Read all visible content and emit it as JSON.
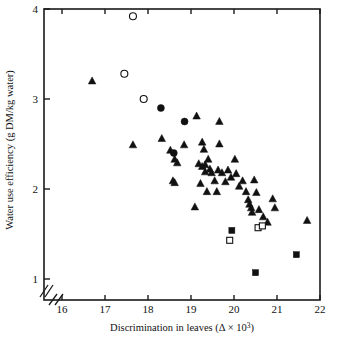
{
  "figure": {
    "background": "#ffffff",
    "frame_color": "#1a1a1a",
    "marker_color": "#111111"
  },
  "axes": {
    "x": {
      "label_main": "Discrimination in leaves (",
      "label_symbol": "Δ × 10",
      "label_exp": "3",
      "label_close": ")",
      "label_full": "Discrimination in leaves (Δ × 10³)",
      "ticks": [
        "16",
        "17",
        "18",
        "19",
        "20",
        "21",
        "22"
      ],
      "tick_values": [
        16,
        17,
        18,
        19,
        20,
        21,
        22
      ],
      "range": [
        15.55,
        22
      ],
      "broken": true
    },
    "y": {
      "label_full": "Water use efficiency (g DM/kg water)",
      "ticks": [
        "1",
        "2",
        "3",
        "4"
      ],
      "tick_values": [
        1,
        2,
        3,
        4
      ],
      "range": [
        0.78,
        4
      ],
      "broken": true
    }
  },
  "chart_data": {
    "type": "scatter",
    "title": "",
    "xlabel": "Discrimination in leaves (Δ × 10³)",
    "ylabel": "Water use efficiency (g DM/kg water)",
    "xlim": [
      15.55,
      22
    ],
    "ylim": [
      0.78,
      4
    ],
    "grid": false,
    "legend": "none",
    "xticks": [
      16,
      17,
      18,
      19,
      20,
      21,
      22
    ],
    "yticks": [
      1,
      2,
      3,
      4
    ],
    "series": [
      {
        "name": "filled-triangle",
        "marker": "triangle",
        "fill": "solid",
        "points": [
          [
            16.7,
            3.2
          ],
          [
            17.65,
            2.49
          ],
          [
            18.32,
            2.56
          ],
          [
            18.52,
            2.43
          ],
          [
            18.62,
            2.33
          ],
          [
            18.68,
            2.29
          ],
          [
            18.58,
            2.09
          ],
          [
            18.62,
            2.07
          ],
          [
            18.84,
            2.49
          ],
          [
            19.13,
            2.81
          ],
          [
            19.26,
            2.52
          ],
          [
            19.3,
            2.44
          ],
          [
            19.18,
            2.28
          ],
          [
            19.26,
            2.25
          ],
          [
            19.33,
            2.27
          ],
          [
            19.33,
            2.19
          ],
          [
            19.4,
            2.33
          ],
          [
            19.44,
            2.22
          ],
          [
            19.48,
            2.18
          ],
          [
            19.37,
            1.97
          ],
          [
            19.22,
            2.06
          ],
          [
            19.09,
            1.8
          ],
          [
            19.55,
            2.09
          ],
          [
            19.6,
            1.97
          ],
          [
            19.66,
            2.75
          ],
          [
            19.66,
            2.5
          ],
          [
            19.63,
            2.21
          ],
          [
            19.72,
            2.18
          ],
          [
            19.8,
            2.08
          ],
          [
            19.86,
            2.21
          ],
          [
            19.93,
            2.13
          ],
          [
            20.02,
            2.33
          ],
          [
            20.05,
            2.17
          ],
          [
            20.12,
            2.03
          ],
          [
            20.2,
            2.09
          ],
          [
            20.28,
            1.97
          ],
          [
            20.33,
            1.88
          ],
          [
            20.36,
            1.83
          ],
          [
            20.4,
            1.79
          ],
          [
            20.42,
            1.74
          ],
          [
            20.47,
            2.1
          ],
          [
            20.52,
            1.96
          ],
          [
            20.58,
            1.77
          ],
          [
            20.68,
            1.69
          ],
          [
            20.78,
            1.63
          ],
          [
            20.9,
            1.89
          ],
          [
            20.95,
            1.79
          ],
          [
            21.7,
            1.65
          ]
        ]
      },
      {
        "name": "filled-circle",
        "marker": "circle",
        "fill": "solid",
        "points": [
          [
            18.3,
            2.9
          ],
          [
            18.85,
            2.75
          ],
          [
            18.6,
            2.4
          ]
        ]
      },
      {
        "name": "open-circle",
        "marker": "circle",
        "fill": "open",
        "points": [
          [
            17.65,
            3.92
          ],
          [
            17.45,
            3.28
          ],
          [
            17.9,
            3.0
          ]
        ]
      },
      {
        "name": "filled-square",
        "marker": "square",
        "fill": "solid",
        "points": [
          [
            19.95,
            1.54
          ],
          [
            20.5,
            1.07
          ],
          [
            21.45,
            1.27
          ]
        ]
      },
      {
        "name": "open-square",
        "marker": "square",
        "fill": "open",
        "points": [
          [
            19.9,
            1.43
          ],
          [
            20.56,
            1.57
          ],
          [
            20.66,
            1.59
          ]
        ]
      }
    ]
  }
}
